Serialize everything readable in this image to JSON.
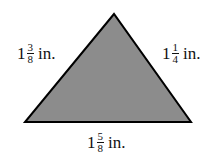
{
  "figure": {
    "shape": "triangle",
    "fill_color": "#8c8c8c",
    "stroke_color": "#000000",
    "vertices": [
      [
        114,
        14
      ],
      [
        25,
        122
      ],
      [
        191,
        122
      ]
    ]
  },
  "labels": {
    "left": {
      "whole": "1",
      "numerator": "3",
      "denominator": "8",
      "unit": "in."
    },
    "right": {
      "whole": "1",
      "numerator": "1",
      "denominator": "4",
      "unit": "in."
    },
    "bottom": {
      "whole": "1",
      "numerator": "5",
      "denominator": "8",
      "unit": "in."
    }
  }
}
